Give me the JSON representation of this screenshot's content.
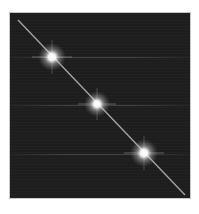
{
  "image": {
    "description": "Dark square field with a thin bright diagonal line and three bright glowing spots along it",
    "background_color": "#1e1e1e",
    "line_color": "#bdbdbd",
    "spot_color": "#ffffff",
    "line": {
      "x1": 18,
      "y1": 20,
      "x2": 185,
      "y2": 195
    },
    "spots": [
      {
        "x": 52,
        "y": 57
      },
      {
        "x": 97,
        "y": 104
      },
      {
        "x": 144,
        "y": 153
      }
    ]
  }
}
